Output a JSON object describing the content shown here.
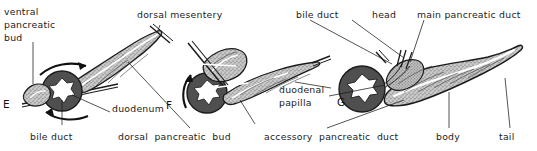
{
  "figure": {
    "background_color": "#ffffff",
    "ink_color": "#1b1b1b",
    "duodenum_wall_color": "#4a4a4a",
    "lumen_color": "#ffffff",
    "pancreas_fill_color": "#b4b4b4",
    "duct_color": "#ffffff"
  },
  "panels": [
    {
      "id": "panel-e",
      "letter": "E"
    },
    {
      "id": "panel-f",
      "letter": "F"
    },
    {
      "id": "panel-g",
      "letter": "G"
    }
  ],
  "labels": {
    "ventral_pancreatic_bud_line1": "ventral",
    "ventral_pancreatic_bud_line2": "pancreatic",
    "ventral_pancreatic_bud_line3": "bud",
    "bile_duct_e": "bile duct",
    "duodenum": "duodenum",
    "dorsal_mesentery": "dorsal mesentery",
    "dorsal_pancreatic_bud": "dorsal  pancreatic  bud",
    "duodenal_papilla_line1": "duodenal",
    "duodenal_papilla_line2": "papilla",
    "bile_duct_g": "bile duct",
    "head": "head",
    "main_pancreatic_duct": "main pancreatic duct",
    "accessory_pancreatic_duct": "accessory  pancreatic  duct",
    "body": "body",
    "tail": "tail"
  }
}
